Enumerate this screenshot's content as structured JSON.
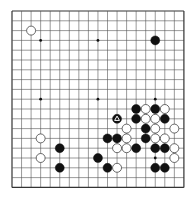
{
  "board": {
    "size": 19,
    "origin_x": 12,
    "origin_y": 11,
    "step_x": 9.55,
    "step_y": 9.8,
    "line_color": "#555555",
    "border_color": "#333333",
    "background": "#ffffff",
    "star_points": [
      [
        3,
        3
      ],
      [
        9,
        3
      ],
      [
        15,
        3
      ],
      [
        3,
        9
      ],
      [
        9,
        9
      ],
      [
        15,
        9
      ],
      [
        3,
        15
      ],
      [
        9,
        15
      ],
      [
        15,
        15
      ]
    ]
  },
  "colors": {
    "black": "#111111",
    "white": "#ffffff",
    "white_stroke": "#444444",
    "marker": "#ffffff"
  },
  "stones": [
    {
      "color": "white",
      "col": 2,
      "row": 2
    },
    {
      "color": "black",
      "col": 15,
      "row": 3
    },
    {
      "color": "black",
      "col": 13,
      "row": 10
    },
    {
      "color": "white",
      "col": 14,
      "row": 10
    },
    {
      "color": "black",
      "col": 15,
      "row": 10
    },
    {
      "color": "white",
      "col": 16,
      "row": 10
    },
    {
      "color": "black",
      "col": 11,
      "row": 11,
      "marker": "triangle"
    },
    {
      "color": "black",
      "col": 13,
      "row": 11
    },
    {
      "color": "white",
      "col": 14,
      "row": 11
    },
    {
      "color": "white",
      "col": 15,
      "row": 11
    },
    {
      "color": "black",
      "col": 16,
      "row": 11
    },
    {
      "color": "white",
      "col": 12,
      "row": 12
    },
    {
      "color": "black",
      "col": 14,
      "row": 12
    },
    {
      "color": "white",
      "col": 15,
      "row": 12
    },
    {
      "color": "white",
      "col": 17,
      "row": 12
    },
    {
      "color": "white",
      "col": 3,
      "row": 13
    },
    {
      "color": "black",
      "col": 10,
      "row": 13
    },
    {
      "color": "black",
      "col": 11,
      "row": 13
    },
    {
      "color": "white",
      "col": 12,
      "row": 13
    },
    {
      "color": "black",
      "col": 14,
      "row": 13
    },
    {
      "color": "white",
      "col": 15,
      "row": 13
    },
    {
      "color": "white",
      "col": 16,
      "row": 13
    },
    {
      "color": "black",
      "col": 5,
      "row": 14
    },
    {
      "color": "white",
      "col": 11,
      "row": 14
    },
    {
      "color": "white",
      "col": 12,
      "row": 14
    },
    {
      "color": "black",
      "col": 13,
      "row": 14
    },
    {
      "color": "black",
      "col": 15,
      "row": 14
    },
    {
      "color": "black",
      "col": 16,
      "row": 14
    },
    {
      "color": "white",
      "col": 17,
      "row": 14
    },
    {
      "color": "white",
      "col": 3,
      "row": 15
    },
    {
      "color": "black",
      "col": 9,
      "row": 15
    },
    {
      "color": "white",
      "col": 17,
      "row": 15
    },
    {
      "color": "black",
      "col": 5,
      "row": 16
    },
    {
      "color": "black",
      "col": 10,
      "row": 16
    },
    {
      "color": "white",
      "col": 11,
      "row": 16
    },
    {
      "color": "black",
      "col": 15,
      "row": 16
    },
    {
      "color": "black",
      "col": 16,
      "row": 16
    }
  ]
}
